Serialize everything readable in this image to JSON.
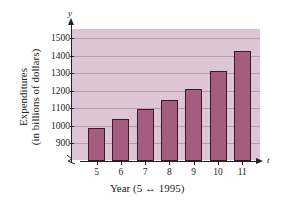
{
  "chart_data": {
    "type": "bar",
    "title": "",
    "xlabel": "Year (5 ↔ 1995)",
    "ylabel": "Expenditures (in billions of dollars)",
    "ylabel_line1": "Expenditures",
    "ylabel_line2": "(in billions of dollars)",
    "x_axis_symbol": "t",
    "y_axis_symbol": "y",
    "categories": [
      "5",
      "6",
      "7",
      "8",
      "9",
      "10",
      "11"
    ],
    "values": [
      988,
      1038,
      1092,
      1146,
      1211,
      1310,
      1425
    ],
    "yticks": [
      "900",
      "1000",
      "1100",
      "1200",
      "1300",
      "1400",
      "1500"
    ],
    "ylim": [
      850,
      1550
    ],
    "y_axis_break": true,
    "grid": true,
    "legend": null,
    "colors": {
      "bar": "#a45c80",
      "background": "#dec5d6",
      "grid": "#b99aad"
    }
  }
}
